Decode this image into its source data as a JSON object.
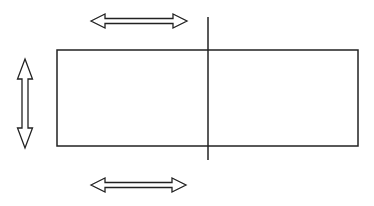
{
  "diagram": {
    "width": 374,
    "height": 206,
    "background": "#ffffff",
    "stroke_color": "#222222",
    "rectangle": {
      "x": 57,
      "y": 50,
      "width": 301,
      "height": 96
    },
    "divider_line": {
      "x": 208,
      "y1": 17,
      "y2": 160
    },
    "arrows": [
      {
        "name": "top-horizontal-arrow",
        "direction": "horizontal",
        "x1": 91,
        "x2": 187,
        "y": 21
      },
      {
        "name": "bottom-horizontal-arrow",
        "direction": "horizontal",
        "x1": 91,
        "x2": 186,
        "y": 185
      },
      {
        "name": "left-vertical-arrow",
        "direction": "vertical",
        "x": 25,
        "y1": 59,
        "y2": 148
      }
    ]
  }
}
